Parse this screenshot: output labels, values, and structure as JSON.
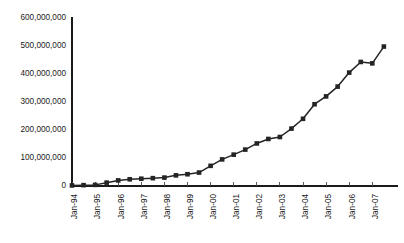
{
  "chart_data": {
    "type": "line",
    "title": "",
    "subtitle": "",
    "xlabel": "",
    "ylabel": "",
    "grid": false,
    "legend": false,
    "legend_position": "none",
    "marker": "square",
    "line_color": "#242424",
    "marker_color": "#242424",
    "axis_color": "#1a1a1a",
    "ylim": [
      0,
      600000000
    ],
    "ytick_values": [
      0,
      100000000,
      200000000,
      300000000,
      400000000,
      500000000,
      600000000
    ],
    "ytick_labels": [
      "0",
      "100,000,000",
      "200,000,000",
      "300,000,000",
      "400,000,000",
      "500,000,000",
      "600,000,000"
    ],
    "xtick_labels": [
      "Jan-94",
      "Jan-95",
      "Jan-96",
      "Jan-97",
      "Jan-98",
      "Jan-99",
      "Jan-00",
      "Jan-01",
      "Jan-02",
      "Jan-03",
      "Jan-04",
      "Jan-05",
      "Jan-06",
      "Jan-07"
    ],
    "xtick_rotation": -90,
    "x_start_year": 1994,
    "x_points_per_year": 2,
    "x": [
      "Jan-94",
      "Jul-94",
      "Jan-95",
      "Jul-95",
      "Jan-96",
      "Jul-96",
      "Jan-97",
      "Jul-97",
      "Jan-98",
      "Jul-98",
      "Jan-99",
      "Jul-99",
      "Jan-00",
      "Jul-00",
      "Jan-01",
      "Jul-01",
      "Jan-02",
      "Jul-02",
      "Jan-03",
      "Jul-03",
      "Jan-04",
      "Jul-04",
      "Jan-05",
      "Jul-05",
      "Jan-06",
      "Jul-06",
      "Jan-07",
      "Jul-07"
    ],
    "values": [
      2000000,
      3000000,
      4000000,
      12000000,
      20000000,
      24000000,
      26000000,
      28000000,
      30000000,
      38000000,
      42000000,
      48000000,
      72000000,
      95000000,
      112000000,
      130000000,
      152000000,
      168000000,
      175000000,
      205000000,
      240000000,
      292000000,
      320000000,
      355000000,
      405000000,
      443000000,
      438000000,
      498000000
    ],
    "series": [
      {
        "name": "",
        "values": [
          2000000,
          3000000,
          4000000,
          12000000,
          20000000,
          24000000,
          26000000,
          28000000,
          30000000,
          38000000,
          42000000,
          48000000,
          72000000,
          95000000,
          112000000,
          130000000,
          152000000,
          168000000,
          175000000,
          205000000,
          240000000,
          292000000,
          320000000,
          355000000,
          405000000,
          443000000,
          438000000,
          498000000
        ]
      }
    ],
    "annotations": []
  }
}
